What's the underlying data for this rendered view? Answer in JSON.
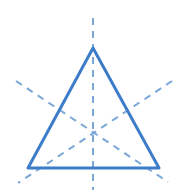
{
  "figure": {
    "background_color": "#ffffff",
    "width": 184,
    "height": 192
  },
  "colors": {
    "solid_stroke": "#3d7cc9",
    "dashed_stroke": "#7ba7d7"
  },
  "chart_data": {
    "type": "diagram",
    "xlabel": "",
    "ylabel": "",
    "grid": false,
    "legend": "none",
    "xlim": [
      0,
      184
    ],
    "ylim": [
      0,
      192
    ],
    "annotations": [],
    "shapes": [
      {
        "name": "triangle",
        "kind": "polygon",
        "style": "solid",
        "stroke": "#3d7cc9",
        "stroke_width": 3,
        "fill": "none",
        "points": [
          [
            93,
            48
          ],
          [
            28,
            168
          ],
          [
            159,
            168
          ]
        ],
        "vertex_labels": [
          "apex",
          "bottom-left",
          "bottom-right"
        ]
      },
      {
        "name": "symmetry-axis-vertical",
        "kind": "line",
        "style": "dashed",
        "stroke": "#7ba7d7",
        "stroke_width": 2,
        "dash_pattern": "7 6",
        "from": [
          93,
          18
        ],
        "to": [
          93,
          190
        ],
        "through": [
          [
            93,
            48
          ],
          [
            93,
            128
          ],
          [
            93,
            168
          ]
        ]
      },
      {
        "name": "symmetry-axis-left-diagonal",
        "kind": "line",
        "style": "dashed",
        "stroke": "#7ba7d7",
        "stroke_width": 2,
        "dash_pattern": "7 6",
        "from": [
          16,
          81
        ],
        "to": [
          168,
          182
        ],
        "through": [
          [
            60.5,
            108
          ],
          [
            93,
            128
          ],
          [
            159,
            168
          ]
        ]
      },
      {
        "name": "symmetry-axis-right-diagonal",
        "kind": "line",
        "style": "dashed",
        "stroke": "#7ba7d7",
        "stroke_width": 2,
        "dash_pattern": "7 6",
        "from": [
          172,
          81
        ],
        "to": [
          18,
          183
        ],
        "through": [
          [
            126,
            108
          ],
          [
            93,
            128
          ],
          [
            28,
            168
          ]
        ]
      }
    ],
    "points": [
      {
        "name": "centroid",
        "x": 93,
        "y": 128
      },
      {
        "name": "vertex-apex",
        "x": 93,
        "y": 48
      },
      {
        "name": "vertex-bottom-left",
        "x": 28,
        "y": 168
      },
      {
        "name": "vertex-bottom-right",
        "x": 159,
        "y": 168
      },
      {
        "name": "midpoint-left-edge",
        "x": 60.5,
        "y": 108
      },
      {
        "name": "midpoint-right-edge",
        "x": 126,
        "y": 108
      },
      {
        "name": "midpoint-base",
        "x": 93.5,
        "y": 168
      }
    ]
  }
}
